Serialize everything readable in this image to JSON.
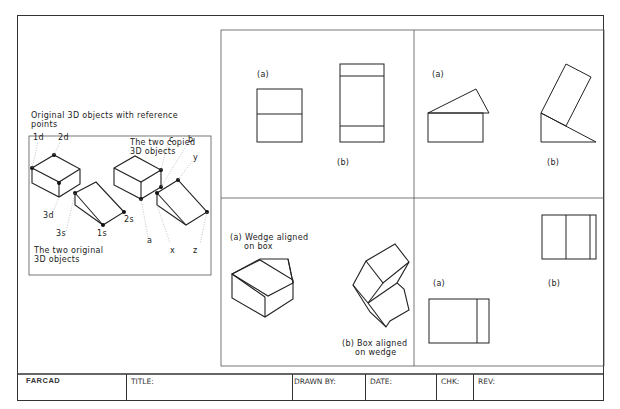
{
  "left_panel": {
    "heading_line1": "Original 3D objects with reference",
    "heading_line2": "points",
    "copied_line1": "The two copied",
    "copied_line2": "3D objects",
    "original_line1": "The two original",
    "original_line2": "3D objects",
    "points": {
      "p1d": "1d",
      "p2d": "2d",
      "p3d": "3d",
      "p1s": "1s",
      "p2s": "2s",
      "p3s": "3s",
      "a": "a",
      "b": "b",
      "c": "c",
      "x": "x",
      "y": "y",
      "z": "z"
    }
  },
  "panels": {
    "top_left": {
      "label_a": "(a)",
      "label_b": "(b)"
    },
    "top_right": {
      "label_a": "(a)",
      "label_b": "(b)"
    },
    "bottom_left": {
      "label_a_line1": "(a) Wedge aligned",
      "label_a_line2": "on box",
      "label_b_line1": "(b) Box aligned",
      "label_b_line2": "on wedge"
    },
    "bottom_right": {
      "label_a": "(a)",
      "label_b": "(b)"
    }
  },
  "title_block": {
    "brand": "FARCAD",
    "title_label": "TITLE:",
    "drawn_by_label": "DRAWN BY:",
    "date_label": "DATE:",
    "chk_label": "CHK:",
    "rev_label": "REV:"
  },
  "colors": {
    "line": "#222222",
    "frame": "#333333",
    "background": "#ffffff"
  }
}
